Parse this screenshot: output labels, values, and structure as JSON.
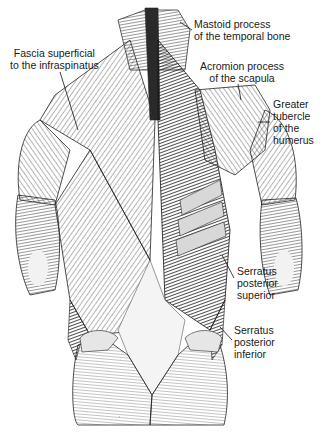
{
  "figure": {
    "labels": [
      {
        "id": "fascia",
        "text": "Fascia superficial\nto the infraspinatus",
        "x": 10,
        "y": 47,
        "align": "center"
      },
      {
        "id": "mastoid",
        "text": "Mastoid process\nof the temporal bone",
        "x": 194,
        "y": 18,
        "align": "left"
      },
      {
        "id": "acromion",
        "text": "Acromion process\nof the scapula",
        "x": 200,
        "y": 60,
        "align": "center"
      },
      {
        "id": "greater_tubercle",
        "text": "Greater\ntubercle\nof the\nhumerus",
        "x": 273,
        "y": 98,
        "align": "left"
      },
      {
        "id": "serratus_sup",
        "text": "Serratus\nposterior\nsuperior",
        "x": 237,
        "y": 265,
        "align": "left"
      },
      {
        "id": "serratus_inf",
        "text": "Serratus\nposterior\ninferior",
        "x": 234,
        "y": 324,
        "align": "left"
      }
    ],
    "leaders": [
      {
        "id": "fascia",
        "x1": 60,
        "y1": 72,
        "x2": 78,
        "y2": 130
      },
      {
        "id": "mastoid",
        "x1": 192,
        "y1": 30,
        "x2": 180,
        "y2": 22
      },
      {
        "id": "acromion",
        "x1": 238,
        "y1": 84,
        "x2": 241,
        "y2": 100
      },
      {
        "id": "greater_tubercle",
        "x1": 270,
        "y1": 122,
        "x2": 258,
        "y2": 122
      },
      {
        "id": "serratus_sup",
        "x1": 234,
        "y1": 278,
        "x2": 222,
        "y2": 255
      },
      {
        "id": "serratus_inf",
        "x1": 232,
        "y1": 340,
        "x2": 220,
        "y2": 327
      }
    ]
  }
}
